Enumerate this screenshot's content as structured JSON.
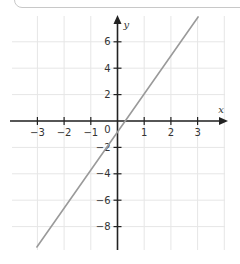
{
  "chart_data": {
    "type": "line",
    "title": "",
    "xlabel": "x",
    "ylabel": "y",
    "xlim": [
      -4,
      4
    ],
    "ylim": [
      -10,
      8
    ],
    "x_ticks": [
      -3,
      -2,
      -1,
      0,
      1,
      2,
      3
    ],
    "y_ticks": [
      -8,
      -6,
      -4,
      -2,
      2,
      4,
      6
    ],
    "grid": true,
    "origin_label": "0",
    "series": [
      {
        "name": "y = 3x - 1",
        "equation": "y = 3x - 1",
        "x": [
          -3,
          3
        ],
        "values": [
          -10,
          8
        ],
        "color": "#9a9a9a"
      }
    ]
  },
  "colors": {
    "axis": "#222222",
    "grid": "#e6e6e6",
    "line": "#9a9a9a"
  }
}
